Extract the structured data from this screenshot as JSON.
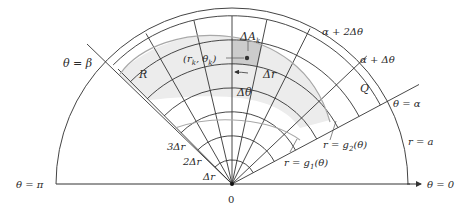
{
  "figure": {
    "origin_label": "0",
    "labels": {
      "theta_beta": "θ = β",
      "theta_alpha": "θ = α",
      "theta_pi": "θ = π",
      "theta_zero": "θ = 0",
      "alpha_plus_2dtheta": "α + 2Δθ",
      "alpha_plus_dtheta": "α + Δθ",
      "region_R": "R",
      "region_Q": "Q",
      "delta_A_k": "ΔA",
      "delta_A_k_sub": "k",
      "point": "(r",
      "point_sub_r": "k",
      "point_mid": ", θ",
      "point_sub_theta": "k",
      "point_end": ")",
      "delta_r": "Δr",
      "delta_theta": "Δθ",
      "three_dr": "3Δr",
      "two_dr": "2Δr",
      "one_dr": "Δr",
      "r_eq_a": "r = a",
      "r_eq_g2": "r = g",
      "r_eq_g2_sub": "2",
      "r_eq_g2_tail": "(θ)",
      "r_eq_g1": "r = g",
      "r_eq_g1_sub": "1",
      "r_eq_g1_tail": "(θ)"
    },
    "colors": {
      "line": "#333333",
      "curve": "#a8a8a8",
      "shade_region": "#ececec",
      "shade_cell": "#c8c8c8"
    }
  }
}
